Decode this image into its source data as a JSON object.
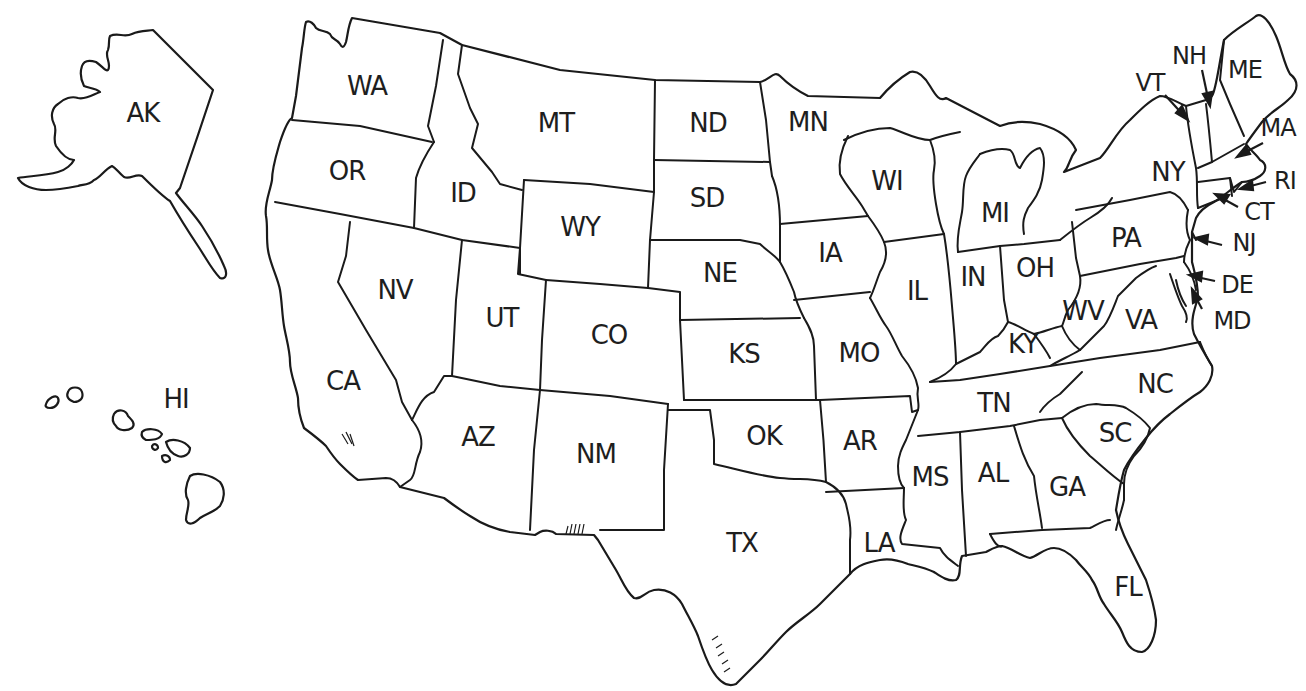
{
  "map": {
    "title": "",
    "background": "#ffffff",
    "line_color": "#1a1a1a",
    "text_color": "#1e1e1e",
    "states": [
      {
        "abbr": "AK",
        "x": 143,
        "y": 113
      },
      {
        "abbr": "HI",
        "x": 176,
        "y": 399
      },
      {
        "abbr": "WA",
        "x": 367,
        "y": 86
      },
      {
        "abbr": "OR",
        "x": 347,
        "y": 171
      },
      {
        "abbr": "ID",
        "x": 463,
        "y": 193
      },
      {
        "abbr": "MT",
        "x": 556,
        "y": 123
      },
      {
        "abbr": "WY",
        "x": 580,
        "y": 227
      },
      {
        "abbr": "NV",
        "x": 395,
        "y": 290
      },
      {
        "abbr": "UT",
        "x": 502,
        "y": 318
      },
      {
        "abbr": "CO",
        "x": 609,
        "y": 335
      },
      {
        "abbr": "CA",
        "x": 343,
        "y": 381
      },
      {
        "abbr": "AZ",
        "x": 478,
        "y": 437
      },
      {
        "abbr": "NM",
        "x": 596,
        "y": 454
      },
      {
        "abbr": "ND",
        "x": 708,
        "y": 123
      },
      {
        "abbr": "SD",
        "x": 707,
        "y": 198
      },
      {
        "abbr": "NE",
        "x": 720,
        "y": 273
      },
      {
        "abbr": "KS",
        "x": 744,
        "y": 354
      },
      {
        "abbr": "OK",
        "x": 764,
        "y": 436
      },
      {
        "abbr": "TX",
        "x": 742,
        "y": 543
      },
      {
        "abbr": "MN",
        "x": 808,
        "y": 122
      },
      {
        "abbr": "IA",
        "x": 830,
        "y": 253
      },
      {
        "abbr": "MO",
        "x": 859,
        "y": 353
      },
      {
        "abbr": "AR",
        "x": 860,
        "y": 441
      },
      {
        "abbr": "LA",
        "x": 879,
        "y": 543
      },
      {
        "abbr": "WI",
        "x": 887,
        "y": 181
      },
      {
        "abbr": "IL",
        "x": 917,
        "y": 291
      },
      {
        "abbr": "MI",
        "x": 995,
        "y": 213
      },
      {
        "abbr": "IN",
        "x": 973,
        "y": 277
      },
      {
        "abbr": "OH",
        "x": 1035,
        "y": 268
      },
      {
        "abbr": "KY",
        "x": 1023,
        "y": 344
      },
      {
        "abbr": "TN",
        "x": 994,
        "y": 403
      },
      {
        "abbr": "MS",
        "x": 930,
        "y": 477
      },
      {
        "abbr": "AL",
        "x": 993,
        "y": 473
      },
      {
        "abbr": "GA",
        "x": 1067,
        "y": 487
      },
      {
        "abbr": "FL",
        "x": 1128,
        "y": 587
      },
      {
        "abbr": "SC",
        "x": 1115,
        "y": 433
      },
      {
        "abbr": "NC",
        "x": 1155,
        "y": 384
      },
      {
        "abbr": "VA",
        "x": 1141,
        "y": 320
      },
      {
        "abbr": "WV",
        "x": 1083,
        "y": 311
      },
      {
        "abbr": "PA",
        "x": 1126,
        "y": 238
      },
      {
        "abbr": "NY",
        "x": 1168,
        "y": 172
      },
      {
        "abbr": "VT",
        "x": 1150,
        "y": 83
      },
      {
        "abbr": "NH",
        "x": 1189,
        "y": 56
      },
      {
        "abbr": "ME",
        "x": 1245,
        "y": 70
      },
      {
        "abbr": "MA",
        "x": 1278,
        "y": 128
      },
      {
        "abbr": "RI",
        "x": 1285,
        "y": 181
      },
      {
        "abbr": "CT",
        "x": 1259,
        "y": 212
      },
      {
        "abbr": "NJ",
        "x": 1244,
        "y": 243
      },
      {
        "abbr": "DE",
        "x": 1237,
        "y": 285
      },
      {
        "abbr": "MD",
        "x": 1232,
        "y": 321
      }
    ],
    "callouts": [
      {
        "abbr": "VT",
        "from": [
          1165,
          95
        ],
        "to": [
          1186,
          118
        ]
      },
      {
        "abbr": "NH",
        "from": [
          1202,
          70
        ],
        "to": [
          1209,
          103
        ]
      },
      {
        "abbr": "MA",
        "from": [
          1263,
          143
        ],
        "to": [
          1240,
          155
        ]
      },
      {
        "abbr": "RI",
        "from": [
          1266,
          182
        ],
        "to": [
          1243,
          188
        ]
      },
      {
        "abbr": "CT",
        "from": [
          1238,
          207
        ],
        "to": [
          1218,
          196
        ]
      },
      {
        "abbr": "NJ",
        "from": [
          1222,
          245
        ],
        "to": [
          1198,
          239
        ]
      },
      {
        "abbr": "DE",
        "from": [
          1215,
          281
        ],
        "to": [
          1192,
          276
        ]
      },
      {
        "abbr": "MD",
        "from": [
          1202,
          309
        ],
        "to": [
          1193,
          292
        ]
      }
    ]
  }
}
